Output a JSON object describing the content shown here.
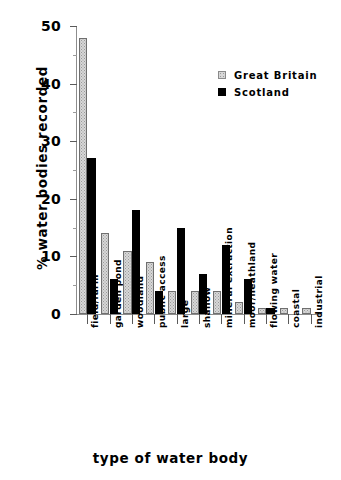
{
  "chart_data": {
    "type": "bar",
    "title": "",
    "xlabel": "type of water body",
    "ylabel": "% water bodies recorded",
    "ylim": [
      0,
      50
    ],
    "yticks": [
      0,
      10,
      20,
      30,
      40,
      50
    ],
    "yticklabels": [
      "0",
      "10",
      "20",
      "30",
      "40",
      "50"
    ],
    "yminor_ticks": [
      5,
      15,
      25,
      35,
      45
    ],
    "grid": false,
    "legend_position": "top-right",
    "categories": [
      "field/farm",
      "garden pond",
      "woodland",
      "public access",
      "large",
      "shallow",
      "mineral extraction",
      "moor/heathland",
      "flowing water",
      "coastal",
      "industrial"
    ],
    "series": [
      {
        "name": "Great Britain",
        "color": "#d7d7d7",
        "values": [
          48,
          14,
          11,
          9,
          4,
          4,
          4,
          2,
          1,
          1,
          1
        ]
      },
      {
        "name": "Scotland",
        "color": "#000000",
        "values": [
          27,
          6,
          18,
          4,
          15,
          7,
          12,
          6,
          1,
          0,
          0
        ]
      }
    ]
  },
  "legend": {
    "items": [
      {
        "label": "Great Britain",
        "swatch": "gb-swatch-icon"
      },
      {
        "label": "Scotland",
        "swatch": "sc-swatch-icon"
      }
    ]
  }
}
